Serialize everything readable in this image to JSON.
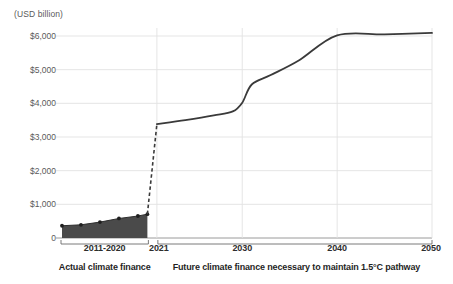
{
  "chart_data": {
    "type": "area",
    "title": "",
    "subtitle": "",
    "unit_label": "(USD billion)",
    "xlabel": "",
    "ylabel": "",
    "ylim": [
      0,
      6500
    ],
    "xlim": [
      2011,
      2050
    ],
    "grid": true,
    "legend_position": "none",
    "yticks": [
      "0",
      "$1,000",
      "$2,000",
      "$3,000",
      "$4,000",
      "$5,000",
      "$6,000"
    ],
    "ytick_values": [
      0,
      1000,
      2000,
      3000,
      4000,
      5000,
      6000
    ],
    "xticks": [
      "2011-2020",
      "2021",
      "2030",
      "2040",
      "2050"
    ],
    "xtick_values": [
      2015.5,
      2021,
      2030,
      2040,
      2050
    ],
    "series": [
      {
        "name": "Actual climate finance",
        "style": "area-with-markers",
        "color": "#4a4a4a",
        "x": [
          2011,
          2013,
          2015,
          2017,
          2019,
          2020
        ],
        "values": [
          364,
          392,
          472,
          580,
          653,
          708
        ]
      },
      {
        "name": "Transition",
        "style": "dashed-line",
        "color": "#3a3a3a",
        "x": [
          2020,
          2021
        ],
        "values": [
          708,
          3380
        ]
      },
      {
        "name": "Future climate finance necessary to maintain 1.5°C pathway",
        "style": "solid-line",
        "color": "#3a3a3a",
        "x": [
          2021,
          2024,
          2027,
          2029,
          2030,
          2031,
          2033,
          2036,
          2040,
          2045,
          2050
        ],
        "values": [
          3380,
          3500,
          3640,
          3760,
          4020,
          4560,
          4840,
          5280,
          6020,
          6050,
          6090
        ]
      }
    ],
    "annotations": [
      {
        "name": "actual-bracket",
        "label": "Actual climate finance",
        "range": [
          2011,
          2020
        ]
      },
      {
        "name": "future-bracket",
        "label": "Future climate finance necessary to maintain 1.5°C pathway",
        "range": [
          2021,
          2050
        ]
      }
    ]
  },
  "colors": {
    "area_fill": "#4a4a4a",
    "line": "#3a3a3a",
    "grid": "#e2e2e2",
    "axis": "#9a9a9a",
    "text": "#2d2d2d",
    "tick_text": "#5a5a5a"
  },
  "axis": {
    "unit": "(USD billion)"
  },
  "brackets": {
    "actual": "Actual climate finance",
    "future": "Future climate finance necessary to maintain 1.5°C pathway"
  }
}
